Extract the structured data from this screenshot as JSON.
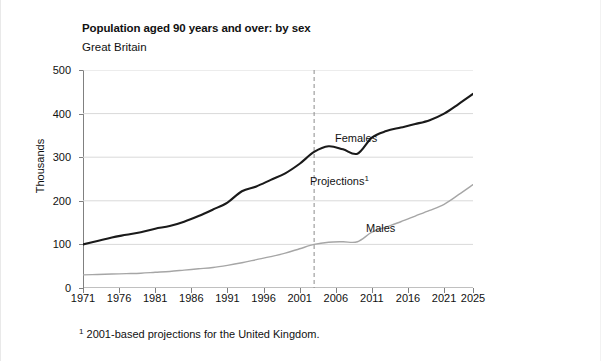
{
  "figure": {
    "title": "Population aged 90 years and over: by sex",
    "subtitle": "Great Britain",
    "footnote_marker": "1",
    "footnote_text": "2001-based projections for the United Kingdom."
  },
  "annotations": {
    "females_label": "Females",
    "males_label": "Males",
    "projections_label": "Projections",
    "projections_marker": "1"
  },
  "colors": {
    "females_line": "#1a1a1a",
    "males_line": "#a6a6a6",
    "gridline": "#d9d9d9",
    "axis": "#808080",
    "projection_divider": "#8c8c8c",
    "background": "#ffffff",
    "text": "#111111"
  },
  "chart_data": {
    "type": "line",
    "title": "Population aged 90 years and over: by sex",
    "subtitle": "Great Britain",
    "xlabel": "",
    "ylabel": "Thousands",
    "xlim": [
      1971,
      2025
    ],
    "ylim": [
      0,
      500
    ],
    "yticks": [
      0,
      100,
      200,
      300,
      400,
      500
    ],
    "xticks": [
      1971,
      1976,
      1981,
      1986,
      1991,
      1996,
      2001,
      2006,
      2011,
      2016,
      2021,
      2025
    ],
    "grid": "horizontal",
    "legend": "inline-labels",
    "projection_start_year": 2003,
    "projection_divider_style": "dashed",
    "series": [
      {
        "name": "Females",
        "color": "#1a1a1a",
        "x": [
          1971,
          1973,
          1975,
          1977,
          1979,
          1981,
          1983,
          1985,
          1987,
          1989,
          1991,
          1993,
          1995,
          1997,
          1999,
          2001,
          2003,
          2005,
          2007,
          2009,
          2011,
          2013,
          2015,
          2017,
          2019,
          2021,
          2023,
          2025
        ],
        "values": [
          100,
          108,
          116,
          122,
          128,
          136,
          142,
          152,
          165,
          180,
          196,
          222,
          233,
          248,
          263,
          285,
          312,
          325,
          318,
          308,
          345,
          360,
          368,
          376,
          385,
          400,
          422,
          445
        ]
      },
      {
        "name": "Males",
        "color": "#a6a6a6",
        "x": [
          1971,
          1973,
          1975,
          1977,
          1979,
          1981,
          1983,
          1985,
          1987,
          1989,
          1991,
          1993,
          1995,
          1997,
          1999,
          2001,
          2003,
          2005,
          2007,
          2009,
          2011,
          2013,
          2015,
          2017,
          2019,
          2021,
          2023,
          2025
        ],
        "values": [
          30,
          31,
          32,
          33,
          34,
          36,
          38,
          41,
          44,
          47,
          52,
          58,
          65,
          72,
          80,
          90,
          100,
          105,
          106,
          106,
          128,
          140,
          152,
          165,
          178,
          192,
          214,
          237
        ]
      }
    ]
  }
}
